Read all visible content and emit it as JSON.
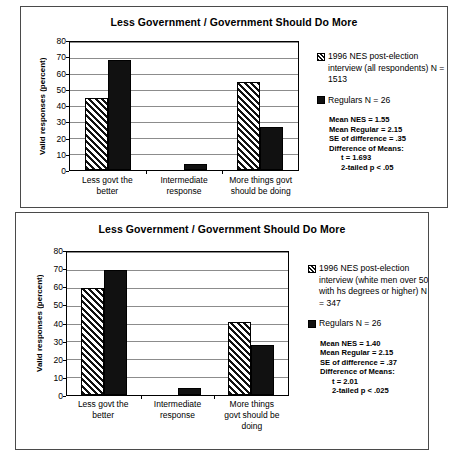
{
  "charts": [
    {
      "title": "Less Government / Government Should Do More",
      "ylabel": "Valid responses (percent)",
      "yticks": [
        "80",
        "70",
        "60",
        "50",
        "40",
        "30",
        "20",
        "10",
        "0"
      ],
      "categories": [
        "Less govt the better",
        "Intermediate response",
        "More things govt should be doing"
      ],
      "category_lines": [
        [
          "Less govt the",
          "better"
        ],
        [
          "Intermediate",
          "response"
        ],
        [
          "More things govt",
          "should be doing"
        ]
      ],
      "legend": [
        {
          "marker": "hatch-swatch",
          "label": "1996 NES post-election interview (all respondents) N = 1513"
        },
        {
          "marker": "solid-swatch",
          "label": "Regulars N = 26"
        }
      ],
      "stats": [
        "Mean NES = 1.55",
        "Mean Regular = 2.15",
        "SE of difference = .35",
        "Difference of Means:",
        "t = 1.693",
        "2-tailed p < .05"
      ],
      "chart_data": {
        "type": "bar",
        "title": "Less Government / Government Should Do More",
        "xlabel": "",
        "ylabel": "Valid responses (percent)",
        "ylim": [
          0,
          80
        ],
        "ytick_step": 10,
        "grid": "horizontal",
        "legend_position": "right",
        "categories": [
          "Less govt the better",
          "Intermediate response",
          "More things govt should be doing"
        ],
        "series": [
          {
            "name": "1996 NES post-election interview (all respondents) N = 1513",
            "pattern": "hatch",
            "values": [
              45,
              0,
              55
            ]
          },
          {
            "name": "Regulars N = 26",
            "pattern": "solid",
            "values": [
              69,
              4,
              27
            ]
          }
        ]
      }
    },
    {
      "title": "Less Government / Government Should Do More",
      "ylabel": "Valid responses (percent)",
      "yticks": [
        "80",
        "70",
        "60",
        "50",
        "40",
        "30",
        "20",
        "10",
        "0"
      ],
      "categories": [
        "Less govt the better",
        "Intermediate response",
        "More things govt should be doing"
      ],
      "category_lines": [
        [
          "Less govt the",
          "better"
        ],
        [
          "Intermediate",
          "response"
        ],
        [
          "More things",
          "govt should be",
          "doing"
        ]
      ],
      "legend": [
        {
          "marker": "hatch-swatch",
          "label": "1996 NES post-election interview (white men over 50 with hs degrees or higher) N = 347"
        },
        {
          "marker": "solid-swatch",
          "label": "Regulars N = 26"
        }
      ],
      "stats": [
        "Mean NES = 1.40",
        "Mean Regular = 2.15",
        "SE of difference = .37",
        "Difference of Means:",
        "t = 2.01",
        "2-tailed p < .025"
      ],
      "chart_data": {
        "type": "bar",
        "title": "Less Government / Government Should Do More",
        "xlabel": "",
        "ylabel": "Valid responses (percent)",
        "ylim": [
          0,
          80
        ],
        "ytick_step": 10,
        "grid": "horizontal",
        "legend_position": "right",
        "categories": [
          "Less govt the better",
          "Intermediate response",
          "More things govt should be doing"
        ],
        "series": [
          {
            "name": "1996 NES post-election interview (white men over 50 with hs degrees or higher) N = 347",
            "pattern": "hatch",
            "values": [
              60,
              0,
              41
            ]
          },
          {
            "name": "Regulars N = 26",
            "pattern": "solid",
            "values": [
              70,
              4,
              28
            ]
          }
        ]
      }
    }
  ]
}
